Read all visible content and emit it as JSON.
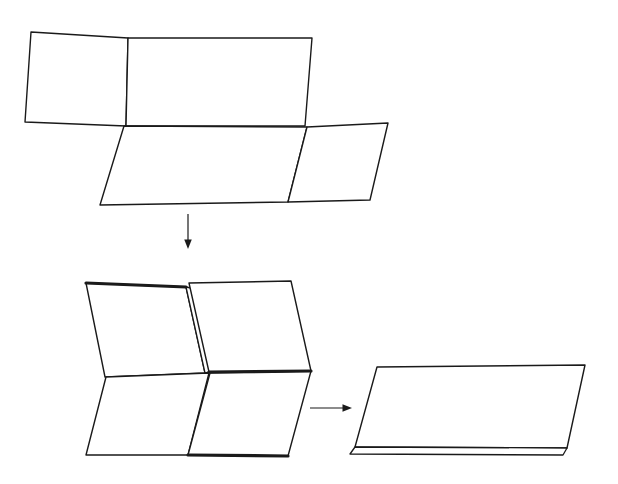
{
  "figure": {
    "background_color": "#ffffff",
    "stroke_color": "#1a1a1a",
    "fill_color": "#ffffff",
    "width": 618,
    "height": 484,
    "stage_count": 3,
    "line_style": "hand-drawn black outline, no labels"
  },
  "chart_data": {
    "type": "diagram",
    "xlabel": "",
    "ylabel": "",
    "stages": [
      {
        "name": "unfolded-sheet",
        "label": "",
        "description": "Open sheet with four quadrant panels seen in perspective",
        "panels": [
          {
            "name": "top-left-panel",
            "points": "31,32 128,38 126,126 25,122",
            "stroke_width": 1.4
          },
          {
            "name": "top-right-panel",
            "points": "128,38 312,38 305,126 126,126",
            "stroke_width": 1.4
          },
          {
            "name": "bottom-left-panel",
            "points": "124,126 307,127 288,202 100,205",
            "stroke_width": 1.4
          },
          {
            "name": "bottom-right-panel",
            "points": "307,127 388,123 370,200 288,202",
            "stroke_width": 1.4
          }
        ]
      },
      {
        "name": "half-folded-sheet",
        "label": "",
        "description": "Sheet folded once, left half lifted revealing a thin folded spine",
        "panels": [
          {
            "name": "upper-left-panel",
            "points": "86,283 186,287 205,373 105,377",
            "stroke_width": 1.4
          },
          {
            "name": "fold-spine-sliver",
            "points": "186,287 191,288 210,372 205,373",
            "stroke_width": 1.3
          },
          {
            "name": "upper-right-panel",
            "points": "189,283 291,281 311,371 209,372",
            "stroke_width": 1.4
          },
          {
            "name": "lower-left-panel",
            "points": "106,377 209,373 188,455 86,455",
            "stroke_width": 1.4
          },
          {
            "name": "lower-right-panel",
            "points": "210,373 311,371 288,456 188,455",
            "stroke_width": 1.4
          }
        ],
        "thick_edges": [
          {
            "name": "upper-left-top-shadow-edge",
            "points": "86,283 186,287",
            "stroke_width": 3.2
          },
          {
            "name": "upper-right-bottom-shadow-edge",
            "points": "209,372 311,371",
            "stroke_width": 3.2
          },
          {
            "name": "lower-right-bottom-shadow-edge",
            "points": "188,455 288,456",
            "stroke_width": 3.2
          }
        ]
      },
      {
        "name": "fully-folded-stack",
        "label": "",
        "description": "Finished folded packet, a flat quadrilateral with a second sheet edge beneath",
        "panels": [
          {
            "name": "folded-top-sheet",
            "points": "377,367 585,365 567,448 355,447",
            "stroke_width": 1.4
          },
          {
            "name": "folded-under-sheet-edge",
            "points": "355,447 567,448 563,455 350,454",
            "stroke_width": 1.3
          }
        ]
      }
    ],
    "arrows": [
      {
        "name": "arrow-down",
        "direction": "down",
        "from": [
          188,
          214
        ],
        "to": [
          188,
          249
        ],
        "stroke_width": 1.2,
        "head_size": 5
      },
      {
        "name": "arrow-right",
        "direction": "right",
        "from": [
          310,
          408
        ],
        "to": [
          352,
          408
        ],
        "stroke_width": 1.2,
        "head_size": 5
      }
    ]
  }
}
